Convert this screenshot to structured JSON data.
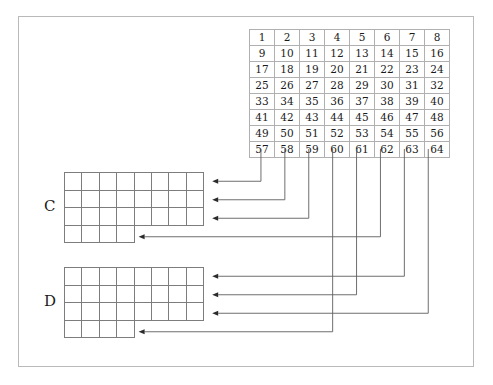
{
  "figure": {
    "background_color": "#ffffff",
    "frame_color": "#b9b9b9",
    "wire_color": "#5d5d5d",
    "arrowhead_color": "#2b2b2b"
  },
  "source_grid": {
    "name": "source-matrix",
    "rows": 8,
    "cols": 8,
    "cells": [
      [
        1,
        2,
        3,
        4,
        5,
        6,
        7,
        8
      ],
      [
        9,
        10,
        11,
        12,
        13,
        14,
        15,
        16
      ],
      [
        17,
        18,
        19,
        20,
        21,
        22,
        23,
        24
      ],
      [
        25,
        26,
        27,
        28,
        29,
        30,
        31,
        32
      ],
      [
        33,
        34,
        35,
        36,
        37,
        38,
        39,
        40
      ],
      [
        41,
        42,
        43,
        44,
        45,
        46,
        47,
        48
      ],
      [
        49,
        50,
        51,
        52,
        53,
        54,
        55,
        56
      ],
      [
        57,
        58,
        59,
        60,
        61,
        62,
        63,
        64
      ]
    ]
  },
  "dest_grids": [
    {
      "label": "C",
      "rows": [
        8,
        8,
        8,
        4
      ]
    },
    {
      "label": "D",
      "rows": [
        8,
        8,
        8,
        4
      ]
    }
  ],
  "connections": [
    {
      "from_cell": 57,
      "to_grid": "C",
      "to_row": 1
    },
    {
      "from_cell": 58,
      "to_grid": "C",
      "to_row": 2
    },
    {
      "from_cell": 59,
      "to_grid": "C",
      "to_row": 3
    },
    {
      "from_cell": 62,
      "to_grid": "C",
      "to_row": 4
    },
    {
      "from_cell": 63,
      "to_grid": "D",
      "to_row": 1
    },
    {
      "from_cell": 61,
      "to_grid": "D",
      "to_row": 2
    },
    {
      "from_cell": 64,
      "to_grid": "D",
      "to_row": 3
    },
    {
      "from_cell": 60,
      "to_grid": "D",
      "to_row": 4
    }
  ]
}
